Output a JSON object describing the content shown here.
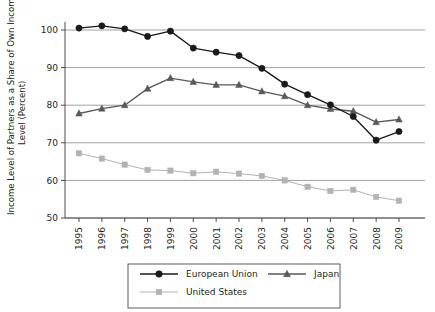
{
  "chart_data": {
    "type": "line",
    "title": "",
    "xlabel": "",
    "ylabel": "Income Level of Partners as a Share of Own Income Level (Percent)",
    "ylabel_line1": "Income Level of Partners as a Share of Own Income",
    "ylabel_line2": "Level (Percent)",
    "categories": [
      "1995",
      "1996",
      "1997",
      "1998",
      "1999",
      "2000",
      "2001",
      "2002",
      "2003",
      "2004",
      "2005",
      "2006",
      "2007",
      "2008",
      "2009"
    ],
    "ylim": [
      50,
      103
    ],
    "yticks": [
      50,
      60,
      70,
      80,
      90,
      100
    ],
    "ytick_labels": [
      "50",
      "60",
      "70",
      "80",
      "90",
      "100"
    ],
    "grid": true,
    "grid_axis": "y",
    "legend_position": "bottom",
    "series": [
      {
        "name": "European Union",
        "marker": "circle",
        "color": "#1a1a1a",
        "values": [
          100.5,
          101.1,
          100.3,
          98.3,
          99.7,
          95.2,
          94.1,
          93.2,
          89.8,
          85.6,
          82.8,
          80.1,
          77.0,
          70.7,
          73.0
        ]
      },
      {
        "name": "Japan",
        "marker": "triangle",
        "color": "#595959",
        "values": [
          77.8,
          79.1,
          80.0,
          84.4,
          87.2,
          86.2,
          85.4,
          85.4,
          83.7,
          82.4,
          80.0,
          79.0,
          78.4,
          75.5,
          76.2
        ]
      },
      {
        "name": "United States",
        "marker": "square",
        "color": "#b3b3b3",
        "values": [
          67.2,
          65.8,
          64.2,
          62.8,
          62.6,
          61.9,
          62.3,
          61.8,
          61.2,
          60.0,
          58.3,
          57.2,
          57.5,
          55.6,
          54.6
        ]
      }
    ]
  },
  "legend": {
    "entries": [
      {
        "label": "European Union"
      },
      {
        "label": "Japan"
      },
      {
        "label": "United States"
      }
    ]
  }
}
